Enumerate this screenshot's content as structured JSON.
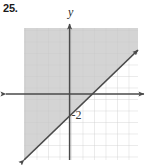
{
  "problem": {
    "number": "25."
  },
  "figure": {
    "y_axis_label": "y",
    "intercept_annotation": "-2"
  },
  "colors": {
    "shade_fill": "#d4d4d4",
    "grid_line": "#c6c6c6",
    "grid_line_light": "#e8e8e8",
    "axis": "#4a4a4a",
    "boundary_line": "#4a4a4a",
    "text": "#1a1a1a"
  },
  "chart_data": {
    "type": "line",
    "title": "",
    "subtitle": "",
    "xlabel": "",
    "ylabel": "y",
    "xlim": [
      -4,
      6
    ],
    "ylim": [
      -6,
      6
    ],
    "grid": true,
    "grid_step": 1,
    "legend": "none",
    "axes": {
      "x_axis_visible": true,
      "y_axis_visible": true,
      "x_axis_arrows": "both",
      "y_axis_arrows": "up",
      "tick_labels": []
    },
    "series": [
      {
        "name": "boundary line",
        "type": "line",
        "style": "solid",
        "arrows": "both",
        "slope": 1,
        "intercept": -2,
        "equation": "y = x - 2",
        "points": [
          [
            -4,
            -6
          ],
          [
            0,
            -2
          ],
          [
            6,
            4
          ]
        ]
      }
    ],
    "shaded_region": {
      "relation": "y >= x - 2",
      "side": "above",
      "fill": "#d4d4d4",
      "boundary": "solid"
    },
    "annotations": [
      {
        "text": "-2",
        "x": 0,
        "y": -2,
        "describes": "y-intercept"
      }
    ]
  }
}
